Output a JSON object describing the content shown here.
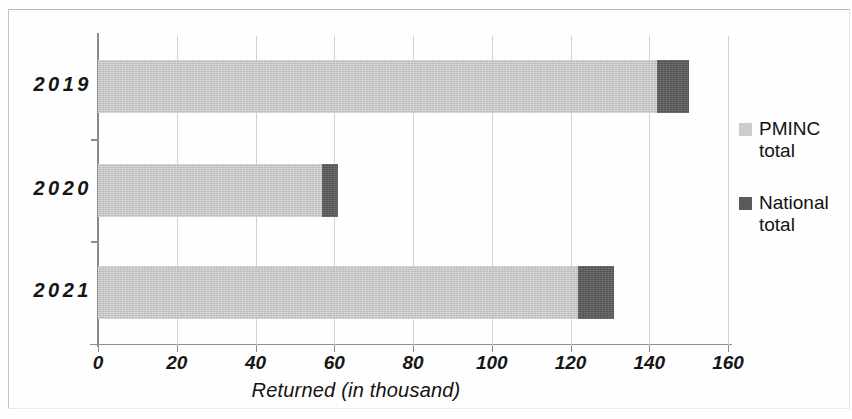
{
  "chart_data": {
    "type": "bar",
    "orientation": "horizontal",
    "stacked": true,
    "title": "",
    "xlabel": "Returned (in thousand)",
    "ylabel": "",
    "categories": [
      "2019",
      "2020",
      "2021"
    ],
    "series": [
      {
        "name": "PMINC total",
        "color": "#c9c9c9",
        "values": [
          142,
          57,
          122
        ]
      },
      {
        "name": "National total",
        "color": "#565656",
        "values": [
          8,
          4,
          9
        ]
      }
    ],
    "totals": [
      150,
      61,
      131
    ],
    "xlim": [
      0,
      160
    ],
    "xticks": [
      0,
      20,
      40,
      60,
      80,
      100,
      120,
      140,
      160
    ],
    "xtick_labels": [
      "0",
      "20",
      "40",
      "60",
      "80",
      "100",
      "120",
      "140",
      "160"
    ],
    "grid": "vertical",
    "legend_position": "right"
  },
  "legend": {
    "entries": [
      {
        "label": "PMINC\ntotal",
        "swatch": "#cdcdcd"
      },
      {
        "label": "National\ntotal",
        "swatch": "#5a5a5a"
      }
    ]
  }
}
